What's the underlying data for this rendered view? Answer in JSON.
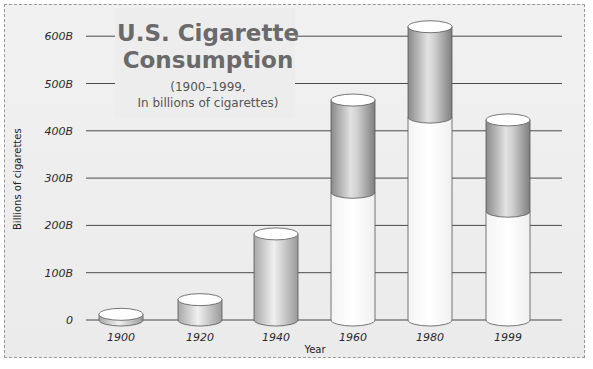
{
  "chart_data": {
    "type": "bar",
    "title": "U.S. Cigarette Consumption",
    "subtitle": "(1900–1999, In billions of cigarettes)",
    "subtitle_lines": [
      "(1900–1999,",
      "In billions of cigarettes)"
    ],
    "xlabel": "Year",
    "ylabel": "Billions of cigarettes",
    "ylim": [
      0,
      600
    ],
    "y_ticks": [
      "0",
      "100B",
      "200B",
      "300B",
      "400B",
      "500B",
      "600B"
    ],
    "y_tick_values": [
      0,
      100,
      200,
      300,
      400,
      500,
      600
    ],
    "grid": true,
    "categories": [
      "1900",
      "1920",
      "1940",
      "1960",
      "1980",
      "1999"
    ],
    "values": [
      12,
      43,
      182,
      465,
      620,
      423
    ],
    "series": [
      {
        "name": "lower (white) segment",
        "values": [
          12,
          43,
          182,
          270,
          429,
          230
        ]
      },
      {
        "name": "upper (gray) segment",
        "values": [
          0,
          0,
          0,
          195,
          191,
          193
        ]
      }
    ],
    "style": "3D cylinders; 1960–1999 cylinders split into white lower and gray upper portion"
  },
  "colors": {
    "background": "#ececec",
    "gridline": "#4a4a4a",
    "cylinder_gray": "#9a9a9a",
    "cylinder_white": "#ffffff",
    "title": "#6a6a6a"
  }
}
